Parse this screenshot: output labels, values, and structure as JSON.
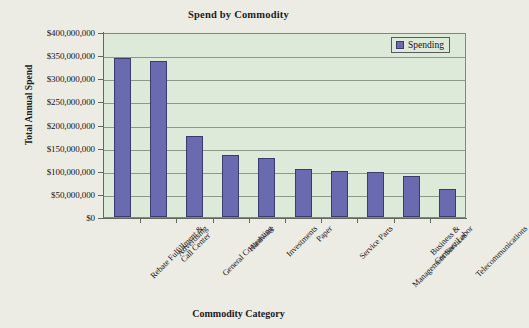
{
  "chart_data": {
    "type": "bar",
    "title": "Spend by Commodity",
    "xlabel": "Commodity Category",
    "ylabel": "Total Annual Spend",
    "grid": true,
    "legend_position": "top-right",
    "ylim": [
      0,
      400000000
    ],
    "ytick_step": 50000000,
    "ytick_labels": [
      "$400,000,000",
      "$350,000,000",
      "$300,000,000",
      "$250,000,000",
      "$200,000,000",
      "$150,000,000",
      "$100,000,000",
      "$50,000,000",
      "$0"
    ],
    "ytick_values": [
      400000000,
      350000000,
      300000000,
      250000000,
      200000000,
      150000000,
      100000000,
      50000000,
      0
    ],
    "categories": [
      "Rebate Fulfillment &\nCall Center",
      "Advertising",
      "General Contracting",
      "Hardware",
      "Investments",
      "Paper",
      "Service Parts",
      "Business &\nManagement Services",
      "Contract Labor",
      "Telecommunications"
    ],
    "series": [
      {
        "name": "Spending",
        "color": "#6a6ab0",
        "values": [
          343000000,
          337000000,
          175000000,
          135000000,
          127000000,
          103000000,
          100000000,
          98000000,
          88000000,
          61000000
        ]
      }
    ],
    "plot_background": "#dde9d9",
    "page_background": "#edece4"
  },
  "legend": {
    "items": [
      {
        "label": "Spending",
        "color": "#6a6ab0"
      }
    ]
  }
}
